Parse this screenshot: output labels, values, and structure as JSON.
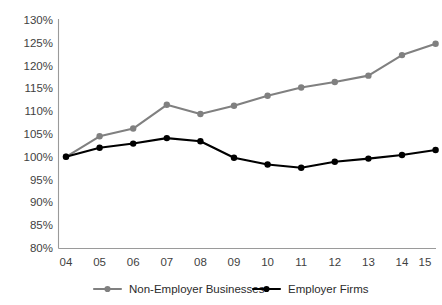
{
  "chart_data": {
    "type": "line",
    "title": "",
    "subtitle": "",
    "xlabel": "",
    "ylabel": "",
    "categories": [
      "04",
      "05",
      "06",
      "07",
      "08",
      "09",
      "10",
      "11",
      "12",
      "13",
      "14",
      "15"
    ],
    "ylim": [
      80,
      130
    ],
    "ytick_values": [
      80,
      85,
      90,
      95,
      100,
      105,
      110,
      115,
      120,
      125,
      130
    ],
    "ytick_labels": [
      "80%",
      "85%",
      "90%",
      "95%",
      "100%",
      "105%",
      "110%",
      "115%",
      "120%",
      "125%",
      "130%"
    ],
    "xtick_labels": [
      "04",
      "05",
      "06",
      "07",
      "08",
      "09",
      "10",
      "11",
      "12",
      "13",
      "14",
      "15"
    ],
    "grid": false,
    "legend_position": "bottom",
    "value_suffix": "%",
    "series": [
      {
        "name": "Non-Employer Businesses",
        "color": "#808080",
        "marker": "circle",
        "values": [
          100.0,
          104.5,
          106.2,
          111.4,
          109.4,
          111.2,
          113.4,
          115.2,
          116.4,
          117.8,
          122.3,
          124.8
        ]
      },
      {
        "name": "Employer Firms",
        "color": "#000000",
        "marker": "circle",
        "values": [
          100.0,
          102.0,
          102.9,
          104.1,
          103.4,
          99.8,
          98.3,
          97.6,
          98.9,
          99.6,
          100.4,
          101.5
        ]
      }
    ]
  },
  "axis": {
    "axis_color": "#9a9a9a",
    "tick_label_color": "#3f3f3f"
  },
  "legend": {
    "entries": [
      {
        "label": "Non-Employer Businesses",
        "color": "#808080"
      },
      {
        "label": "Employer Firms",
        "color": "#000000"
      }
    ]
  }
}
